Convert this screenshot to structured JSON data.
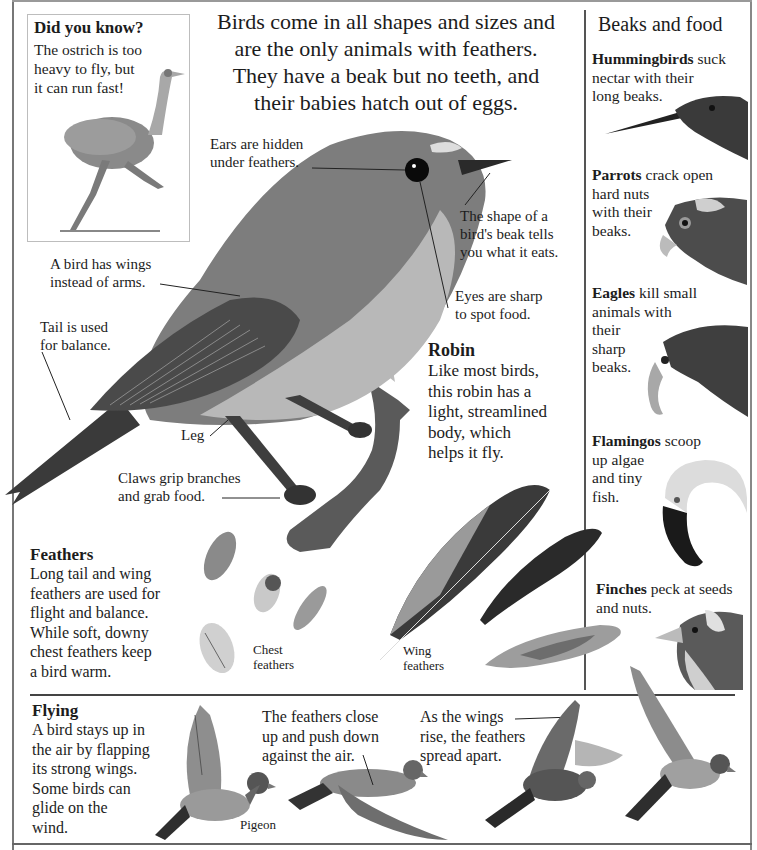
{
  "did_you_know": {
    "title": "Did you know?",
    "lines": [
      "The ostrich is too",
      "heavy to fly, but",
      "it can run fast!"
    ]
  },
  "intro": {
    "lines": [
      "Birds come in all shapes and sizes and",
      "are the only animals with feathers.",
      "They have a beak but no teeth, and",
      "their babies hatch out of eggs."
    ]
  },
  "robin_labels": {
    "ears": [
      "Ears are hidden",
      "under feathers."
    ],
    "beak": [
      "The shape of a",
      "bird's beak tells",
      "you what it eats."
    ],
    "eyes": [
      "Eyes are sharp",
      "to spot food."
    ],
    "wings": [
      "A bird has wings",
      "instead of arms."
    ],
    "tail": [
      "Tail is used",
      "for balance."
    ],
    "leg": "Leg",
    "claws": [
      "Claws grip branches",
      "and grab food."
    ]
  },
  "robin": {
    "title": "Robin",
    "lines": [
      "Like most birds,",
      "this robin has a",
      "light, streamlined",
      "body, which",
      "helps it fly."
    ]
  },
  "beaks_and_food": {
    "title": "Beaks and food",
    "items": [
      {
        "bird": "Hummingbirds",
        "lines": [
          " suck",
          "nectar with their",
          "long beaks."
        ]
      },
      {
        "bird": "Parrots",
        "lines": [
          " crack open",
          "hard nuts",
          "with their",
          "beaks."
        ]
      },
      {
        "bird": "Eagles",
        "lines": [
          " kill small",
          "animals with",
          "their",
          "sharp",
          "beaks."
        ]
      },
      {
        "bird": "Flamingos",
        "lines": [
          " scoop",
          "up algae",
          "and tiny",
          "fish."
        ]
      },
      {
        "bird": "Finches",
        "lines": [
          " peck at seeds",
          "and nuts."
        ]
      }
    ]
  },
  "feathers": {
    "title": "Feathers",
    "lines": [
      "Long tail and wing",
      "feathers are used for",
      "flight and balance.",
      "While soft, downy",
      "chest feathers keep",
      "a bird warm."
    ],
    "chest_label": [
      "Chest",
      "feathers"
    ],
    "wing_label": [
      "Wing",
      "feathers"
    ]
  },
  "flying": {
    "title": "Flying",
    "lines": [
      "A bird stays up in",
      "the air by flapping",
      "its strong wings.",
      "Some birds can",
      "glide on the",
      "wind."
    ],
    "pigeon_label": "Pigeon",
    "caption_down": [
      "The feathers close",
      "up and push down",
      "against the air."
    ],
    "caption_up": [
      "As the wings",
      "rise, the feathers",
      "spread apart."
    ]
  },
  "colors": {
    "ink": "#1c1c1c",
    "rule": "#444444",
    "paper": "#ffffff"
  }
}
